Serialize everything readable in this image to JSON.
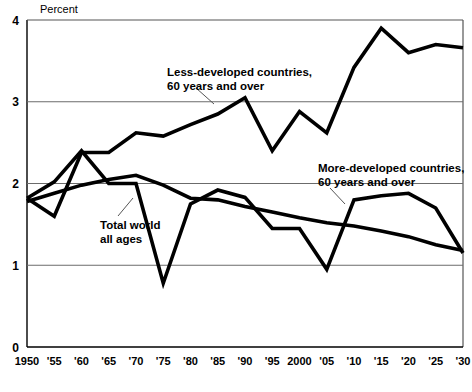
{
  "chart_data": {
    "type": "line",
    "title": "",
    "subtitle": "",
    "ylabel": "Percent",
    "xlabel": "",
    "ylim": [
      0,
      4
    ],
    "yticks": [
      0,
      1,
      2,
      3,
      4
    ],
    "ytick_labels": [
      "0",
      "1",
      "2",
      "3",
      "4"
    ],
    "grid": "horizontal gridlines at 1, 2, 3",
    "legend_position": "inline annotations on plot",
    "x": [
      1950,
      1955,
      1960,
      1965,
      1970,
      1975,
      1980,
      1985,
      1990,
      1995,
      2000,
      2005,
      2010,
      2015,
      2020,
      2025,
      2030
    ],
    "categories": [
      "1950",
      "'55",
      "'60",
      "'65",
      "'70",
      "'75",
      "'80",
      "'85",
      "'90",
      "'95",
      "2000",
      "'05",
      "'10",
      "'15",
      "'20",
      "'25",
      "'30"
    ],
    "series": [
      {
        "name": "Less-developed countries, 60 years and over",
        "values": [
          1.82,
          1.6,
          2.38,
          2.38,
          2.62,
          2.58,
          2.72,
          2.85,
          3.05,
          2.4,
          2.88,
          2.62,
          3.42,
          3.9,
          3.6,
          3.7,
          3.66
        ]
      },
      {
        "name": "Total world, all ages",
        "values": [
          1.78,
          1.88,
          1.98,
          2.05,
          2.1,
          1.98,
          1.82,
          1.8,
          1.72,
          1.65,
          1.58,
          1.52,
          1.48,
          1.42,
          1.35,
          1.25,
          1.18
        ]
      },
      {
        "name": "More-developed countries, 60 years and over",
        "values": [
          1.82,
          2.02,
          2.4,
          2.0,
          2.0,
          0.78,
          1.75,
          1.92,
          1.83,
          1.45,
          1.45,
          0.95,
          1.8,
          1.85,
          1.88,
          1.7,
          1.15
        ]
      }
    ],
    "annotations": [
      {
        "name": "less-developed-annotation",
        "line1": "Less-developed countries,",
        "line2": "60 years and over"
      },
      {
        "name": "total-world-annotation",
        "line1": "Total world",
        "line2": "all ages"
      },
      {
        "name": "more-developed-annotation",
        "line1": "More-developed countries,",
        "line2": "60 years and over"
      }
    ],
    "colors": {
      "line": "#000000",
      "grid": "#6b6b6b",
      "axis": "#000000",
      "background": "#ffffff"
    }
  }
}
